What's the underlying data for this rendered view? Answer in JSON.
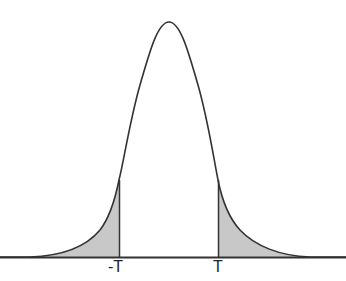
{
  "diagram": {
    "type": "two-tailed probability density curve",
    "title_cropped": "",
    "curve_color": "#333333",
    "shade_color": "#c8c8c8",
    "baseline_color": "#333333",
    "labels": {
      "left_threshold": "-T",
      "right_threshold": "T"
    },
    "shaded_regions": [
      {
        "name": "left-tail",
        "from": "-inf",
        "to": "-T"
      },
      {
        "name": "right-tail",
        "from": "T",
        "to": "+inf"
      }
    ]
  }
}
